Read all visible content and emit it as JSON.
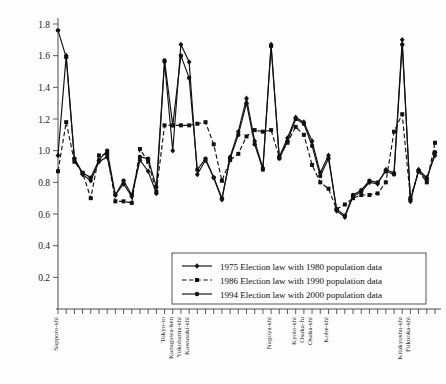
{
  "chart_data": {
    "type": "line",
    "title": "",
    "subtitle": "",
    "xlabel": "",
    "ylabel": "",
    "ylim": [
      0.0,
      1.8
    ],
    "yticks": [
      0.2,
      0.4,
      0.6,
      0.8,
      1.0,
      1.2,
      1.4,
      1.6,
      1.8
    ],
    "ytick_labels": [
      "0.2",
      "0.4",
      "0.6",
      "0.8",
      "1.0",
      "1.2",
      "1.4",
      "1.6",
      "1.8"
    ],
    "grid": false,
    "legend_position": "lower-center",
    "n_points": 47,
    "x_annotations": [
      {
        "index": 0,
        "label": "Sapporo-shi"
      },
      {
        "index": 13,
        "label": "Tokyo-to"
      },
      {
        "index": 14,
        "label": "Kanagawa-ken"
      },
      {
        "index": 15,
        "label": "Yokohama-shi"
      },
      {
        "index": 16,
        "label": "Kawasaki-shi"
      },
      {
        "index": 26,
        "label": "Nagoya-shi"
      },
      {
        "index": 29,
        "label": "Kyoto-shi"
      },
      {
        "index": 30,
        "label": "Osaka-fu"
      },
      {
        "index": 31,
        "label": "Osaka-shi"
      },
      {
        "index": 33,
        "label": "Kobe-shi"
      },
      {
        "index": 42,
        "label": "Kitakyushu-shi"
      },
      {
        "index": 43,
        "label": "Fukuoka-shi"
      }
    ],
    "series": [
      {
        "name": "1975 Election law with 1980 population data",
        "style": "solid",
        "marker": "diamond",
        "values": [
          0.97,
          1.6,
          0.95,
          0.85,
          0.81,
          0.93,
          0.96,
          0.72,
          0.79,
          0.71,
          0.94,
          0.87,
          0.73,
          1.56,
          1.0,
          1.67,
          1.56,
          0.85,
          0.94,
          0.83,
          0.69,
          0.96,
          1.12,
          1.33,
          1.06,
          0.89,
          1.67,
          0.96,
          1.08,
          1.21,
          1.18,
          1.06,
          0.86,
          0.97,
          0.62,
          0.58,
          0.71,
          0.74,
          0.8,
          0.79,
          0.88,
          0.86,
          1.7,
          0.68,
          0.88,
          0.83,
          0.97
        ]
      },
      {
        "name": "1986 Election law with 1990 population data",
        "style": "dashed",
        "marker": "square",
        "values": [
          0.87,
          1.18,
          0.93,
          0.86,
          0.7,
          0.97,
          0.98,
          0.68,
          0.68,
          0.67,
          1.01,
          0.93,
          0.74,
          1.16,
          1.16,
          1.16,
          1.16,
          1.17,
          1.18,
          1.04,
          0.81,
          0.94,
          0.98,
          1.09,
          1.13,
          1.12,
          1.13,
          0.96,
          1.05,
          1.15,
          1.1,
          0.91,
          0.8,
          0.76,
          0.63,
          0.66,
          0.7,
          0.72,
          0.72,
          0.73,
          0.8,
          1.12,
          1.23,
          0.7,
          0.87,
          0.8,
          1.05
        ]
      },
      {
        "name": "1994 Election law with 2000 population data",
        "style": "solid",
        "marker": "circle",
        "values": [
          1.76,
          1.59,
          0.95,
          0.86,
          0.83,
          0.94,
          1.0,
          0.72,
          0.81,
          0.72,
          0.96,
          0.95,
          0.77,
          1.57,
          1.16,
          1.6,
          1.46,
          0.88,
          0.95,
          0.83,
          0.7,
          0.95,
          1.1,
          1.3,
          1.04,
          0.88,
          1.66,
          0.95,
          1.06,
          1.2,
          1.17,
          1.03,
          0.84,
          0.95,
          0.63,
          0.59,
          0.72,
          0.75,
          0.81,
          0.8,
          0.87,
          0.85,
          1.67,
          0.69,
          0.87,
          0.82,
          0.99
        ]
      }
    ]
  },
  "legend": {
    "items": [
      {
        "label": "1975 Election law with 1980 population data"
      },
      {
        "label": "1986 Election law with 1990 population data"
      },
      {
        "label": "1994 Election law with 2000 population data"
      }
    ]
  }
}
